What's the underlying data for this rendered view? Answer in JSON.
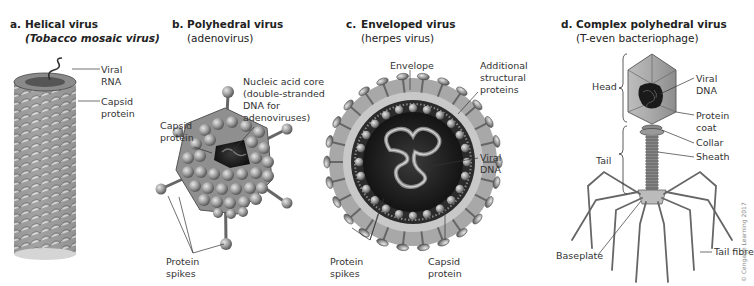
{
  "figure": {
    "panels": [
      {
        "letter": "a.",
        "title": "Helical virus",
        "subtitle": "(Tobacco mosaic virus)",
        "labels": {
          "viral_rna": [
            "Viral",
            "RNA"
          ],
          "capsid_protein": [
            "Capsid",
            "protein"
          ]
        }
      },
      {
        "letter": "b.",
        "title": "Polyhedral virus",
        "subtitle": "(adenovirus)",
        "labels": {
          "nucleic_acid_core": [
            "Nucleic acid core",
            "(double-stranded",
            "DNA for",
            "adenoviruses)"
          ],
          "capsid_protein": [
            "Capsid",
            "protein"
          ],
          "protein_spikes": [
            "Protein",
            "spikes"
          ]
        }
      },
      {
        "letter": "c.",
        "title": "Enveloped virus",
        "subtitle": "(herpes virus)",
        "labels": {
          "envelope": "Envelope",
          "additional_structural_proteins": [
            "Additional",
            "structural",
            "proteins"
          ],
          "viral_dna": [
            "Viral",
            "DNA"
          ],
          "protein_spikes": [
            "Protein",
            "spikes"
          ],
          "capsid_protein": [
            "Capsid",
            "protein"
          ]
        }
      },
      {
        "letter": "d.",
        "title": "Complex polyhedral virus",
        "subtitle": "(T-even bacteriophage)",
        "labels": {
          "head": "Head",
          "tail": "Tail",
          "viral_dna": [
            "Viral",
            "DNA"
          ],
          "protein_coat": [
            "Protein",
            "coat"
          ],
          "collar": "Collar",
          "sheath": "Sheath",
          "baseplate": "Baseplate",
          "tail_fibre": "Tail fibre"
        }
      }
    ],
    "credit": "© Cengage Learning 2017"
  }
}
